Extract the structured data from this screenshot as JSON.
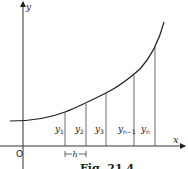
{
  "figure": {
    "caption": "Fig. 21.4",
    "axes": {
      "x_label": "x",
      "y_label": "y",
      "origin_label": "O"
    },
    "step_label": "h",
    "ordinates": [
      {
        "name": "y",
        "sub": "1"
      },
      {
        "name": "y",
        "sub": "2"
      },
      {
        "name": "y",
        "sub": "3"
      },
      {
        "name": "y",
        "sub": "n−1"
      },
      {
        "name": "y",
        "sub": "n"
      }
    ],
    "colors": {
      "line": "#222222",
      "axis": "#333333",
      "background": "#ffffff"
    }
  }
}
